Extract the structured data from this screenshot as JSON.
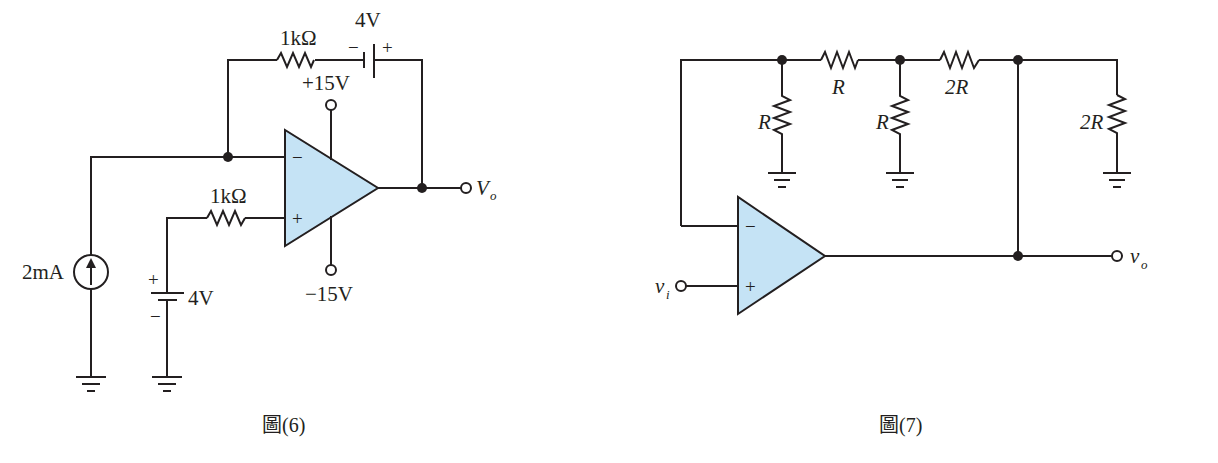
{
  "figures": [
    {
      "id": "fig6",
      "caption": "圖(6)",
      "feedback_resistor": "1kΩ",
      "feedback_battery": {
        "value": "4V",
        "minus": "−",
        "plus": "+"
      },
      "input_resistor": "1kΩ",
      "current_source": "2mA",
      "input_battery": {
        "value": "4V",
        "plus": "+",
        "minus": "−"
      },
      "supply_positive": "+15V",
      "supply_negative": "−15V",
      "opamp": {
        "inverting": "−",
        "noninverting": "+"
      },
      "output": {
        "symbol": "V",
        "subscript": "o"
      }
    },
    {
      "id": "fig7",
      "caption": "圖(7)",
      "series_resistors": [
        "R",
        "2R"
      ],
      "shunt_resistors": [
        "R",
        "R",
        "2R"
      ],
      "opamp": {
        "inverting": "−",
        "noninverting": "+"
      },
      "input": {
        "symbol": "v",
        "subscript": "i"
      },
      "output": {
        "symbol": "v",
        "subscript": "o"
      }
    }
  ],
  "colors": {
    "opamp_fill": "#c5e3f5",
    "wire": "#231f20",
    "background": "#ffffff"
  }
}
